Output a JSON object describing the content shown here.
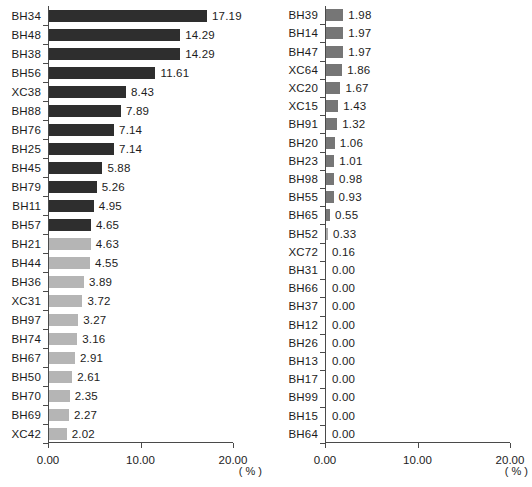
{
  "chart_data": {
    "type": "bar",
    "title": "",
    "orientation": "horizontal",
    "xlabel": "( % )",
    "ylabel": "",
    "xlim": [
      0,
      20
    ],
    "xticks": [
      "0.00",
      "10.00",
      "20.00"
    ],
    "xtick_values": [
      0,
      10,
      20
    ],
    "grid": false,
    "legend": "none",
    "panels": [
      {
        "name": "left-panel",
        "unit": "( % )",
        "categories": [
          "BH34",
          "BH48",
          "BH38",
          "BH56",
          "XC38",
          "BH88",
          "BH76",
          "BH25",
          "BH45",
          "BH79",
          "BH11",
          "BH57",
          "BH21",
          "BH44",
          "BH36",
          "XC31",
          "BH97",
          "BH74",
          "BH67",
          "BH50",
          "BH70",
          "BH69",
          "XC42"
        ],
        "values": [
          17.19,
          14.29,
          14.29,
          11.61,
          8.43,
          7.89,
          7.14,
          7.14,
          5.88,
          5.26,
          4.95,
          4.65,
          4.63,
          4.55,
          3.89,
          3.72,
          3.27,
          3.16,
          2.91,
          2.61,
          2.35,
          2.27,
          2.02
        ],
        "labels": [
          "17.19",
          "14.29",
          "14.29",
          "11.61",
          "8.43",
          "7.89",
          "7.14",
          "7.14",
          "5.88",
          "5.26",
          "4.95",
          "4.65",
          "4.63",
          "4.55",
          "3.89",
          "3.72",
          "3.27",
          "3.16",
          "2.91",
          "2.61",
          "2.35",
          "2.27",
          "2.02"
        ],
        "colors": [
          "#2e2e2e",
          "#2e2e2e",
          "#2e2e2e",
          "#2e2e2e",
          "#2e2e2e",
          "#2e2e2e",
          "#2e2e2e",
          "#2e2e2e",
          "#2e2e2e",
          "#2e2e2e",
          "#2e2e2e",
          "#2e2e2e",
          "#b5b5b5",
          "#b5b5b5",
          "#b5b5b5",
          "#b5b5b5",
          "#b5b5b5",
          "#b5b5b5",
          "#b5b5b5",
          "#b5b5b5",
          "#b5b5b5",
          "#b5b5b5",
          "#b5b5b5"
        ]
      },
      {
        "name": "right-panel",
        "unit": "( % )",
        "categories": [
          "BH39",
          "BH14",
          "BH47",
          "XC64",
          "XC20",
          "XC15",
          "BH91",
          "BH20",
          "BH23",
          "BH98",
          "BH55",
          "BH65",
          "BH52",
          "XC72",
          "BH31",
          "BH66",
          "BH37",
          "BH12",
          "BH26",
          "BH13",
          "BH17",
          "BH99",
          "BH15",
          "BH64"
        ],
        "values": [
          1.98,
          1.97,
          1.97,
          1.86,
          1.67,
          1.43,
          1.32,
          1.06,
          1.01,
          0.98,
          0.93,
          0.55,
          0.33,
          0.16,
          0.0,
          0.0,
          0.0,
          0.0,
          0.0,
          0.0,
          0.0,
          0.0,
          0.0,
          0.0
        ],
        "labels": [
          "1.98",
          "1.97",
          "1.97",
          "1.86",
          "1.67",
          "1.43",
          "1.32",
          "1.06",
          "1.01",
          "0.98",
          "0.93",
          "0.55",
          "0.33",
          "0.16",
          "0.00",
          "0.00",
          "0.00",
          "0.00",
          "0.00",
          "0.00",
          "0.00",
          "0.00",
          "0.00",
          "0.00"
        ],
        "colors": [
          "#767676",
          "#767676",
          "#767676",
          "#767676",
          "#767676",
          "#767676",
          "#767676",
          "#767676",
          "#767676",
          "#767676",
          "#767676",
          "#767676",
          "#a8a8a8",
          "#b5b5b5",
          "#b5b5b5",
          "#b5b5b5",
          "#b5b5b5",
          "#b5b5b5",
          "#b5b5b5",
          "#b5b5b5",
          "#b5b5b5",
          "#b5b5b5",
          "#b5b5b5",
          "#b5b5b5"
        ]
      }
    ]
  },
  "colors": {
    "bar_dark": "#2e2e2e",
    "bar_mid": "#767676",
    "bar_light": "#b5b5b5",
    "axis": "#4a4a4a",
    "text": "#1c1c1c",
    "background": "#ffffff"
  },
  "caption": ""
}
